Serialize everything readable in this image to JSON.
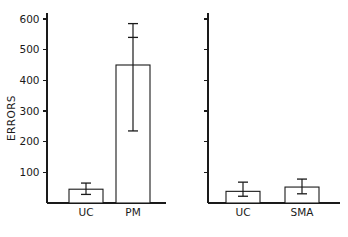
{
  "figure": {
    "background_color": "#ffffff",
    "ink_color": "#1a1a1a",
    "partial_caption": "",
    "axis_title": "ERRORS"
  },
  "chart_data": {
    "type": "bar",
    "title": "",
    "subtitle": "",
    "xlabel": "",
    "ylabel": "ERRORS",
    "ylim": [
      0,
      620
    ],
    "yticks": [
      100,
      200,
      300,
      400,
      500,
      600
    ],
    "ytick_labels": [
      "100",
      "200",
      "300",
      "400",
      "500",
      "600"
    ],
    "grid": false,
    "legend": "none",
    "error_bars": "asymmetric",
    "panels": [
      {
        "name": "left-panel",
        "axis_labeled": true,
        "categories": [
          "UC",
          "PM"
        ],
        "values": [
          45,
          450
        ],
        "err_upper": [
          65,
          585
        ],
        "err_lower": [
          28,
          235
        ],
        "extra_ticks": [
          null,
          540
        ]
      },
      {
        "name": "right-panel",
        "axis_labeled": false,
        "categories": [
          "UC",
          "SMA"
        ],
        "values": [
          38,
          52
        ],
        "err_upper": [
          68,
          78
        ],
        "err_lower": [
          22,
          30
        ],
        "extra_ticks": [
          null,
          null
        ]
      }
    ]
  }
}
